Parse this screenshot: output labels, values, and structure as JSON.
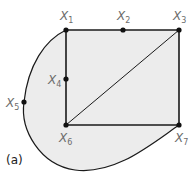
{
  "diagram": {
    "caption": "(a)",
    "colors": {
      "fill": "#ececec",
      "stroke": "#1a1a1a",
      "label": "#6b6b6b"
    },
    "nodes": [
      {
        "id": "x1",
        "label": "X",
        "sub": "1",
        "x": 66,
        "y": 30
      },
      {
        "id": "x2",
        "label": "X",
        "sub": "2",
        "x": 123,
        "y": 30
      },
      {
        "id": "x3",
        "label": "X",
        "sub": "3",
        "x": 179,
        "y": 30
      },
      {
        "id": "x4",
        "label": "X",
        "sub": "4",
        "x": 66,
        "y": 79
      },
      {
        "id": "x5",
        "label": "X",
        "sub": "5",
        "x": 24,
        "y": 102
      },
      {
        "id": "x6",
        "label": "X",
        "sub": "6",
        "x": 66,
        "y": 125
      },
      {
        "id": "x7",
        "label": "X",
        "sub": "7",
        "x": 179,
        "y": 125
      }
    ],
    "edges": [
      [
        "x1",
        "x2"
      ],
      [
        "x2",
        "x3"
      ],
      [
        "x3",
        "x7"
      ],
      [
        "x7",
        "x6"
      ],
      [
        "x6",
        "x4"
      ],
      [
        "x4",
        "x1"
      ],
      [
        "x6",
        "x3"
      ],
      [
        "x1",
        "x5"
      ],
      [
        "x5",
        "x7"
      ]
    ]
  }
}
